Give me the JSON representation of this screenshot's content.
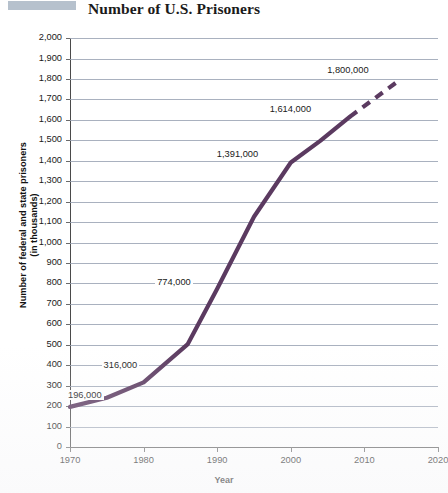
{
  "chart_data": {
    "type": "line",
    "title": "Number of U.S. Prisoners",
    "xlabel": "Year",
    "ylabel": "Number of federal and state prisoners (in thousands)",
    "ylabel_line1": "Number of federal and state prisoners",
    "ylabel_line2": "(in thousands)",
    "xlim": [
      1970,
      2020
    ],
    "ylim": [
      0,
      2000
    ],
    "grid": true,
    "legend": "none",
    "series_color": "#5b3a60",
    "x_ticks": [
      1970,
      1980,
      1990,
      2000,
      2010,
      2020
    ],
    "x_tick_labels": [
      "1970",
      "1980",
      "1990",
      "2000",
      "2010",
      "2020"
    ],
    "y_ticks": [
      0,
      100,
      200,
      300,
      400,
      500,
      600,
      700,
      800,
      900,
      1000,
      1100,
      1200,
      1300,
      1400,
      1500,
      1600,
      1700,
      1800,
      1900,
      2000
    ],
    "y_tick_labels": [
      "0",
      "100",
      "200",
      "300",
      "400",
      "500",
      "600",
      "700",
      "800",
      "900",
      "1,000",
      "1,100",
      "1,200",
      "1,300",
      "1,400",
      "1,500",
      "1,600",
      "1,700",
      "1,800",
      "1,900",
      "2,000"
    ],
    "series": [
      {
        "name": "Federal and state prisoners (actual)",
        "style": "solid",
        "x": [
          1970,
          1975,
          1980,
          1986,
          1990,
          1995,
          2000,
          2004,
          2008
        ],
        "y": [
          196,
          241,
          316,
          503,
          774,
          1126,
          1391,
          1497,
          1614
        ]
      },
      {
        "name": "Federal and state prisoners (projected)",
        "style": "dashed",
        "x": [
          2008,
          2015
        ],
        "y": [
          1614,
          1800
        ]
      }
    ],
    "annotations": [
      {
        "label": "196,000",
        "year": 1970,
        "value": 196
      },
      {
        "label": "316,000",
        "year": 1980,
        "value": 316
      },
      {
        "label": "774,000",
        "year": 1990,
        "value": 774
      },
      {
        "label": "1,391,000",
        "year": 2000,
        "value": 1391
      },
      {
        "label": "1,614,000",
        "year": 2008,
        "value": 1614
      },
      {
        "label": "1,800,000",
        "year": 2015,
        "value": 1800
      }
    ]
  }
}
